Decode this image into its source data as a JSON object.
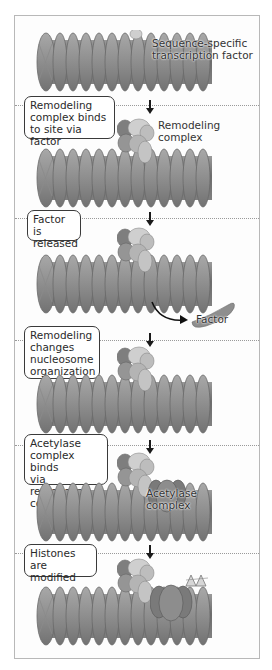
{
  "figure": {
    "frame_color": "#b8b8b8",
    "coil_color": "#8c8c8c",
    "coil_dark": "#6e6e6e",
    "coil_light": "#b4b4b4",
    "remodeling_complex_colors": [
      "#8a8a8a",
      "#cfcfcf",
      "#a9a9a9",
      "#bdbdbd"
    ],
    "acetylase_color": "#7a7a7a",
    "panels": [
      {
        "step": 1,
        "box_label": "",
        "annotations": [
          "Sequence-specific\ntranscription factor"
        ]
      },
      {
        "step": 2,
        "box_label": "Remodeling\ncomplex binds\nto site via factor",
        "annotations": [
          "Remodeling\ncomplex"
        ]
      },
      {
        "step": 3,
        "box_label": "Factor is\nreleased",
        "annotations": [
          "Factor"
        ]
      },
      {
        "step": 4,
        "box_label": "Remodeling\nchanges\nnucleosome\norganization",
        "annotations": []
      },
      {
        "step": 5,
        "box_label": "Acetylase\ncomplex binds\nvia remodeling\ncomplex",
        "annotations": [
          "Acetylase\ncomplex"
        ]
      },
      {
        "step": 6,
        "box_label": "Histones are\nmodified",
        "annotations": []
      }
    ]
  }
}
